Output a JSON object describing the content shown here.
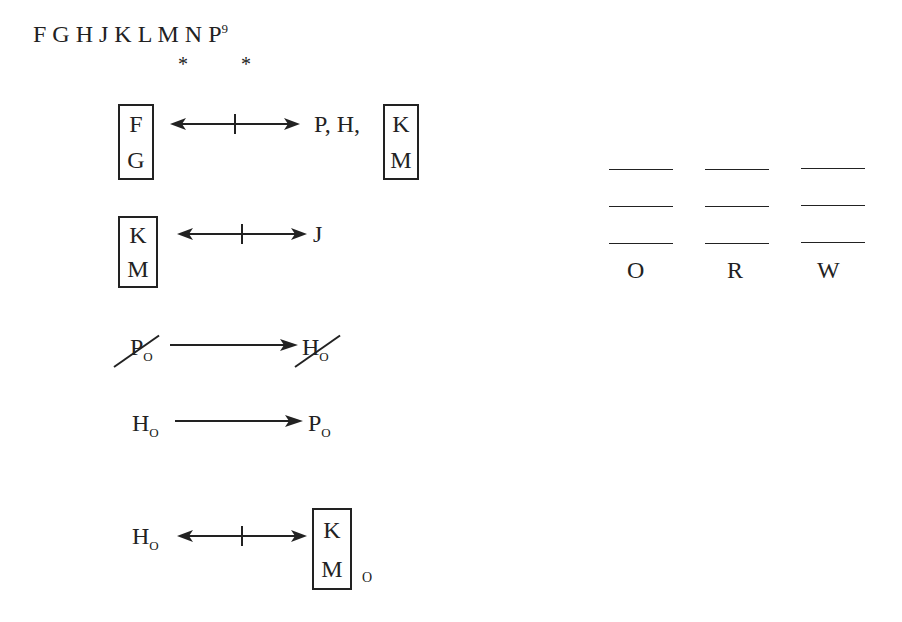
{
  "header": {
    "letters": "F G H J K L M N P",
    "count": "9",
    "stars": [
      "*",
      "*"
    ]
  },
  "rules": [
    {
      "left_box": [
        "F",
        "G"
      ],
      "relation": "not-together",
      "right_text": "P, H,",
      "right_box": [
        "K",
        "M"
      ]
    },
    {
      "left_box": [
        "K",
        "M"
      ],
      "relation": "not-together",
      "right_text": "J"
    },
    {
      "left": "P",
      "left_sub": "O",
      "left_struck": true,
      "relation": "implies",
      "right": "H",
      "right_sub": "O",
      "right_struck": true
    },
    {
      "left": "H",
      "left_sub": "O",
      "relation": "implies",
      "right": "P",
      "right_sub": "O"
    },
    {
      "left": "H",
      "left_sub": "O",
      "relation": "not-together",
      "right_box": [
        "K",
        "M"
      ],
      "right_sub": "O"
    }
  ],
  "groups": [
    {
      "label": "O",
      "slots": 3
    },
    {
      "label": "R",
      "slots": 3
    },
    {
      "label": "W",
      "slots": 3
    }
  ]
}
